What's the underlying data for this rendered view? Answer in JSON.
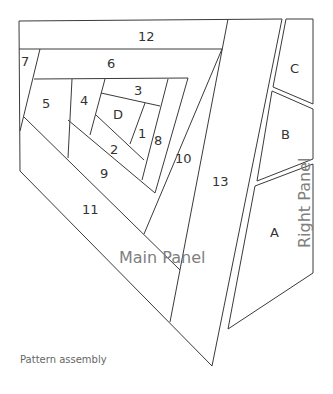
{
  "caption": "Pattern assembly",
  "panels": {
    "main": {
      "label": "Main Panel",
      "pieces": [
        "1",
        "2",
        "3",
        "4",
        "5",
        "6",
        "7",
        "8",
        "9",
        "10",
        "11",
        "12",
        "13",
        "D"
      ]
    },
    "right": {
      "label": "Right Panel",
      "pieces": [
        "A",
        "B",
        "C"
      ]
    }
  },
  "piece_labels": {
    "p1": "1",
    "p2": "2",
    "p3": "3",
    "p4": "4",
    "p5": "5",
    "p6": "6",
    "p7": "7",
    "p8": "8",
    "p9": "9",
    "p10": "10",
    "p11": "11",
    "p12": "12",
    "p13": "13",
    "pD": "D",
    "pA": "A",
    "pB": "B",
    "pC": "C"
  },
  "colors": {
    "line": "#3a3a3a",
    "label": "#808080",
    "text": "#333333"
  }
}
